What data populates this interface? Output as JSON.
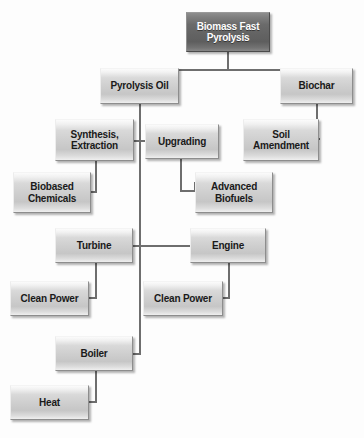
{
  "diagram": {
    "colors": {
      "root_fill": "#646464",
      "root_text": "#ffffff",
      "node_fill": "#cfcfcf",
      "node_text": "#1a1a1a",
      "node_border": "#8d8d8d",
      "connector": "#6e6e6e",
      "background": "#fdfdfd"
    },
    "nodes": [
      {
        "id": "biomass-fast-pyrolysis",
        "label": "Biomass Fast\nPyrolysis",
        "line1": "Biomass Fast",
        "line2": "Pyrolysis",
        "style": "root",
        "x": 186,
        "y": 12,
        "w": 84,
        "h": 40,
        "font_size": 10
      },
      {
        "id": "pyrolysis-oil",
        "label": "Pyrolysis Oil",
        "line1": "Pyrolysis Oil",
        "line2": "",
        "style": "normal",
        "x": 100,
        "y": 68,
        "w": 79,
        "h": 36,
        "font_size": 10
      },
      {
        "id": "biochar",
        "label": "Biochar",
        "line1": "Biochar",
        "line2": "",
        "style": "normal",
        "x": 280,
        "y": 68,
        "w": 73,
        "h": 36,
        "font_size": 10
      },
      {
        "id": "synthesis-extraction",
        "label": "Synthesis,\nExtraction",
        "line1": "Synthesis,",
        "line2": "Extraction",
        "style": "normal",
        "x": 55,
        "y": 119,
        "w": 79,
        "h": 42,
        "font_size": 10
      },
      {
        "id": "upgrading",
        "label": "Upgrading",
        "line1": "Upgrading",
        "line2": "",
        "style": "normal",
        "x": 145,
        "y": 124,
        "w": 74,
        "h": 35,
        "font_size": 10
      },
      {
        "id": "soil-amendment",
        "label": "Soil\nAmendment",
        "line1": "Soil",
        "line2": "Amendment",
        "style": "normal",
        "x": 243,
        "y": 119,
        "w": 76,
        "h": 42,
        "font_size": 10
      },
      {
        "id": "biobased-chemicals",
        "label": "Biobased\nChemicals",
        "line1": "Biobased",
        "line2": "Chemicals",
        "style": "normal",
        "x": 13,
        "y": 172,
        "w": 78,
        "h": 41,
        "font_size": 10
      },
      {
        "id": "advanced-biofuels",
        "label": "Advanced\nBiofuels",
        "line1": "Advanced",
        "line2": "Biofuels",
        "style": "normal",
        "x": 195,
        "y": 172,
        "w": 78,
        "h": 41,
        "font_size": 10
      },
      {
        "id": "turbine",
        "label": "Turbine",
        "line1": "Turbine",
        "line2": "",
        "style": "normal",
        "x": 55,
        "y": 228,
        "w": 78,
        "h": 35,
        "font_size": 10
      },
      {
        "id": "engine",
        "label": "Engine",
        "line1": "Engine",
        "line2": "",
        "style": "normal",
        "x": 190,
        "y": 228,
        "w": 76,
        "h": 35,
        "font_size": 10
      },
      {
        "id": "clean-power-turbine",
        "label": "Clean Power",
        "line1": "Clean Power",
        "line2": "",
        "style": "normal",
        "x": 10,
        "y": 281,
        "w": 79,
        "h": 35,
        "font_size": 10
      },
      {
        "id": "clean-power-engine",
        "label": "Clean Power",
        "line1": "Clean Power",
        "line2": "",
        "style": "normal",
        "x": 143,
        "y": 281,
        "w": 80,
        "h": 35,
        "font_size": 10
      },
      {
        "id": "boiler",
        "label": "Boiler",
        "line1": "Boiler",
        "line2": "",
        "style": "normal",
        "x": 55,
        "y": 336,
        "w": 78,
        "h": 35,
        "font_size": 10
      },
      {
        "id": "heat",
        "label": "Heat",
        "line1": "Heat",
        "line2": "",
        "style": "normal",
        "x": 10,
        "y": 385,
        "w": 79,
        "h": 35,
        "font_size": 10
      }
    ],
    "edges": [
      {
        "id": "root-to-split",
        "from": "biomass-fast-pyrolysis",
        "to": "split-bar"
      },
      {
        "id": "split-to-pyrolysis-oil",
        "from": "split-bar",
        "to": "pyrolysis-oil"
      },
      {
        "id": "split-to-biochar",
        "from": "split-bar",
        "to": "biochar"
      },
      {
        "id": "pyrolysis-oil-to-trunk",
        "from": "pyrolysis-oil",
        "to": "trunk"
      },
      {
        "id": "trunk-to-synthesis",
        "from": "trunk",
        "to": "synthesis-extraction"
      },
      {
        "id": "trunk-to-upgrading",
        "from": "trunk",
        "to": "upgrading"
      },
      {
        "id": "trunk-to-turbine",
        "from": "trunk",
        "to": "turbine"
      },
      {
        "id": "trunk-to-engine",
        "from": "trunk",
        "to": "engine"
      },
      {
        "id": "trunk-to-boiler",
        "from": "trunk",
        "to": "boiler"
      },
      {
        "id": "biochar-to-soil",
        "from": "biochar",
        "to": "soil-amendment"
      },
      {
        "id": "synthesis-to-biobased",
        "from": "synthesis-extraction",
        "to": "biobased-chemicals"
      },
      {
        "id": "upgrading-to-biofuels",
        "from": "upgrading",
        "to": "advanced-biofuels"
      },
      {
        "id": "turbine-to-clean-power",
        "from": "turbine",
        "to": "clean-power-turbine"
      },
      {
        "id": "engine-to-clean-power",
        "from": "engine",
        "to": "clean-power-engine"
      },
      {
        "id": "boiler-to-heat",
        "from": "boiler",
        "to": "heat"
      }
    ]
  }
}
